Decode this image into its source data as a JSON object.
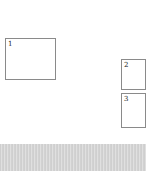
{
  "boxes": [
    {
      "label": "1"
    },
    {
      "label": "2"
    },
    {
      "label": "3"
    }
  ],
  "strip": {
    "color": "#d4d4d4"
  }
}
